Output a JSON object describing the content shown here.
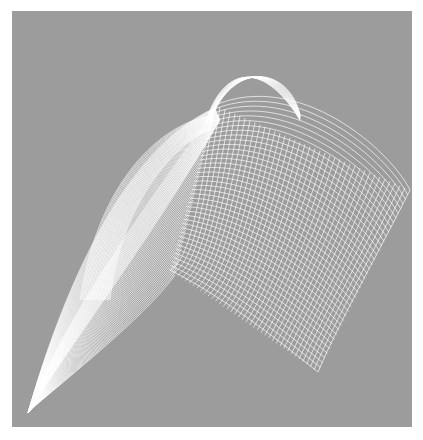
{
  "image": {
    "background": "#ffffff",
    "frame_color": "#9c9c9c",
    "line_color": "#ffffff",
    "frame": {
      "x": 12,
      "y": 11,
      "w": 400,
      "h": 416
    }
  },
  "families": [
    {
      "name": "right-sheet-a",
      "count": 40,
      "from": [
        [
          215,
          105
        ],
        [
          300,
          70
        ],
        [
          390,
          150
        ],
        [
          410,
          190
        ]
      ],
      "to": [
        [
          170,
          270
        ],
        [
          230,
          300
        ],
        [
          290,
          350
        ],
        [
          318,
          372
        ]
      ]
    },
    {
      "name": "right-sheet-b",
      "count": 40,
      "from": [
        [
          215,
          105
        ],
        [
          200,
          200
        ],
        [
          190,
          260
        ],
        [
          170,
          270
        ]
      ],
      "to": [
        [
          410,
          190
        ],
        [
          380,
          250
        ],
        [
          340,
          320
        ],
        [
          318,
          372
        ]
      ]
    },
    {
      "name": "top-arch",
      "count": 18,
      "from": [
        [
          205,
          125
        ],
        [
          220,
          70
        ],
        [
          260,
          55
        ],
        [
          300,
          120
        ]
      ],
      "to": [
        [
          215,
          110
        ],
        [
          240,
          60
        ],
        [
          290,
          70
        ],
        [
          300,
          115
        ]
      ]
    },
    {
      "name": "left-blade-outer",
      "count": 45,
      "from": [
        [
          28,
          413
        ],
        [
          60,
          300
        ],
        [
          120,
          150
        ],
        [
          215,
          108
        ]
      ],
      "to": [
        [
          28,
          413
        ],
        [
          80,
          330
        ],
        [
          150,
          240
        ],
        [
          220,
          120
        ]
      ]
    },
    {
      "name": "left-blade-inner",
      "count": 45,
      "from": [
        [
          30,
          410
        ],
        [
          90,
          360
        ],
        [
          150,
          310
        ],
        [
          175,
          275
        ]
      ],
      "to": [
        [
          28,
          413
        ],
        [
          60,
          330
        ],
        [
          120,
          240
        ],
        [
          215,
          110
        ]
      ]
    },
    {
      "name": "left-lobe",
      "count": 22,
      "from": [
        [
          80,
          300
        ],
        [
          100,
          170
        ],
        [
          170,
          120
        ],
        [
          215,
          115
        ]
      ],
      "to": [
        [
          110,
          300
        ],
        [
          120,
          200
        ],
        [
          180,
          140
        ],
        [
          210,
          130
        ]
      ]
    }
  ]
}
